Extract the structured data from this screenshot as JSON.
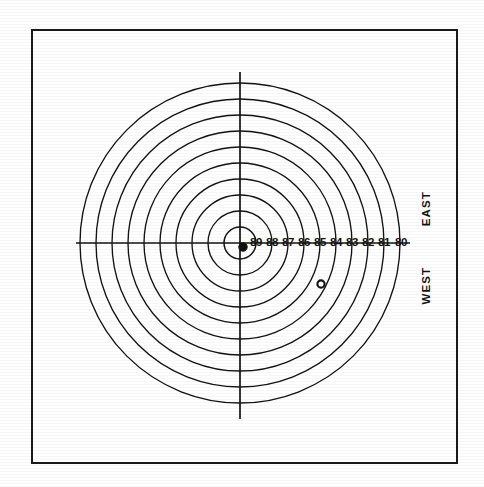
{
  "figure": {
    "background_color": "#ffffff",
    "ink_color": "#121212",
    "frame": {
      "name": "page-border",
      "x": 31,
      "y": 29,
      "width": 427,
      "height": 435,
      "stroke_color": "#1a1a1a",
      "stroke_width": 2.2
    }
  },
  "compass": {
    "east_label": "EAST",
    "west_label": "WEST"
  },
  "chart_data": {
    "type": "scatter",
    "title": "",
    "subtitle": "",
    "xlabel": "",
    "ylabel": "",
    "projection": "polar-range-rings",
    "grid": true,
    "legend_position": "none",
    "center": {
      "x": 240,
      "y": 243
    },
    "ring_spacing_px": 16,
    "rings": [
      {
        "label": "89",
        "radius_px": 16,
        "label_x": 256,
        "label_y": 243
      },
      {
        "label": "88",
        "radius_px": 32,
        "label_x": 272,
        "label_y": 243
      },
      {
        "label": "87",
        "radius_px": 48,
        "label_x": 288,
        "label_y": 243
      },
      {
        "label": "86",
        "radius_px": 64,
        "label_x": 304,
        "label_y": 243
      },
      {
        "label": "85",
        "radius_px": 80,
        "label_x": 320,
        "label_y": 243
      },
      {
        "label": "84",
        "radius_px": 96,
        "label_x": 336,
        "label_y": 243
      },
      {
        "label": "83",
        "radius_px": 112,
        "label_x": 352,
        "label_y": 243
      },
      {
        "label": "82",
        "radius_px": 128,
        "label_x": 368,
        "label_y": 243
      },
      {
        "label": "81",
        "radius_px": 144,
        "label_x": 384,
        "label_y": 243
      },
      {
        "label": "80",
        "radius_px": 160,
        "label_x": 401,
        "label_y": 243
      }
    ],
    "ring_labels": [
      "89",
      "88",
      "87",
      "86",
      "85",
      "84",
      "83",
      "82",
      "81",
      "80"
    ],
    "axes": {
      "horizontal": {
        "x1": 76,
        "y1": 243,
        "x2": 410,
        "y2": 243
      },
      "vertical": {
        "x1": 240,
        "y1": 72,
        "x2": 240,
        "y2": 419
      }
    },
    "markers": [
      {
        "name": "center-station-marker",
        "style": "filled-dot",
        "x": 243,
        "y": 247,
        "radius_px": 4.2,
        "color": "#101010"
      },
      {
        "name": "data-point-marker",
        "style": "open-circle",
        "x": 321,
        "y": 284,
        "radius_px": 3.6,
        "color": "#121212"
      }
    ]
  }
}
